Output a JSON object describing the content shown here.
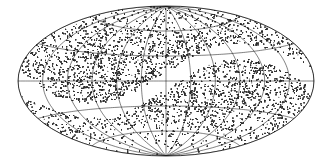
{
  "figure": {
    "title": "",
    "projection_name": "Aitoff equal-area all-sky projection",
    "background_color": "#ffffff",
    "dot_color": "#2b2b2b",
    "grid_color": "#1a1a1a",
    "outline_color": "#111111",
    "width": 332,
    "height": 168
  },
  "chart_data": {
    "type": "scatter",
    "title": "",
    "subtitle": "",
    "xlabel": "",
    "ylabel": "",
    "projection": "aitoff",
    "coordinate_system": "galactic",
    "xlim": [
      -180,
      180
    ],
    "ylim": [
      -90,
      90
    ],
    "grid": true,
    "legend": "none",
    "annotations": [],
    "meridian_tick_labels": [],
    "parallel_tick_labels": [],
    "meridian_step_deg": 30,
    "parallel_step_deg": 30,
    "meridians_deg": [
      -180,
      -150,
      -120,
      -90,
      -60,
      -30,
      0,
      30,
      60,
      90,
      120,
      150,
      180
    ],
    "parallels_deg": [
      -60,
      -30,
      0,
      30,
      60
    ],
    "marker": "point",
    "marker_size_px": 0.55,
    "n_points": 14000,
    "series": [
      {
        "name": "survey galaxies",
        "description": "dense stippled point distribution covering most of the celestial sphere",
        "values": []
      }
    ],
    "masked_regions": [
      {
        "name": "zone-of-avoidance-band",
        "description": "white unobserved strip following the Galactic plane sweeping from lower-left to upper-right",
        "latitude_half_width_deg": 8
      },
      {
        "name": "southern-incomplete-cap",
        "description": "sparser coverage toward the south polar region",
        "below_latitude_deg": -55
      }
    ],
    "density_profile": {
      "equatorial_band": "high",
      "mid_latitude": "high",
      "north_cap": "moderate",
      "south_cap": "sparse"
    }
  }
}
